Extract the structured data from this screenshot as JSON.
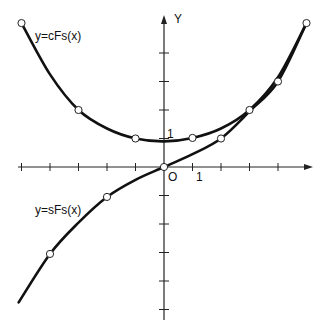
{
  "chart_data": {
    "type": "line",
    "title": "",
    "xlabel": "",
    "ylabel": "Y",
    "origin_label": "O",
    "x_tick_label": "1",
    "y_tick_label": "1",
    "xlim": [
      -5.2,
      5.2
    ],
    "ylim": [
      -4.4,
      5.2
    ],
    "grid": false,
    "legend": "inline labels",
    "x_ticks": [
      -5,
      -4,
      -3,
      -2,
      -1,
      1,
      2,
      3,
      4
    ],
    "y_ticks": [
      -5,
      -4,
      -3,
      -2,
      -1,
      1,
      2,
      3,
      4
    ],
    "series": [
      {
        "name": "y=cFs(x)",
        "label_pos": [
          1,
          1.45
        ],
        "markers": [
          [
            -5,
            5.05
          ],
          [
            -3,
            2.0
          ],
          [
            -1,
            1.0
          ],
          [
            1,
            1.02
          ],
          [
            3,
            2.0
          ],
          [
            5,
            5.05
          ]
        ],
        "x": [
          -5,
          -4,
          -3,
          -2,
          -1,
          0,
          1,
          2,
          3,
          4,
          5
        ],
        "values": [
          5.05,
          3.25,
          2.0,
          1.35,
          1.0,
          0.9,
          1.02,
          1.35,
          2.0,
          3.15,
          5.05
        ]
      },
      {
        "name": "y=sFs(x)",
        "label_pos": [
          1,
          3.05
        ],
        "markers": [
          [
            -4,
            -3.05
          ],
          [
            -2,
            -1.05
          ],
          [
            0,
            0
          ],
          [
            2,
            1.0
          ],
          [
            4,
            3.0
          ]
        ],
        "x": [
          -5.1,
          -4,
          -3,
          -2,
          -1,
          0,
          1,
          2,
          3,
          4,
          5
        ],
        "values": [
          -4.75,
          -3.05,
          -1.95,
          -1.05,
          -0.45,
          0,
          0.45,
          1.0,
          1.95,
          3.0,
          5.05
        ]
      }
    ]
  },
  "labels": {
    "cfs": "y=cFs(x)",
    "sfs": "y=sFs(x)",
    "y_axis": "Y",
    "origin": "O",
    "x_one": "1",
    "y_one": "1"
  }
}
